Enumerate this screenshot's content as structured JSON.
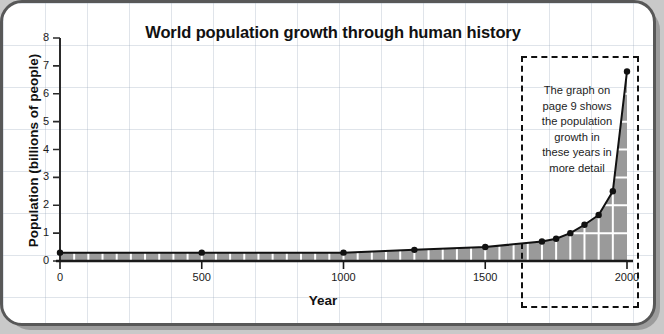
{
  "figure": {
    "title": "World population growth through human history",
    "x_axis_title": "Year",
    "y_axis_title": "Population (billions of people)",
    "callout_text": "The graph on page 9 shows the population growth in these years in more detail",
    "callout_lines": [
      "The graph on",
      "page 9 shows",
      "the population",
      "growth in",
      "these years in",
      "more detail"
    ]
  },
  "colors": {
    "frame_border": "#585858",
    "frame_shadow": "#9c9c9c",
    "page_background": "#c9c9c9",
    "plot_background": "#ffffff",
    "area_fill": "#9a9a9a",
    "line": "#111111",
    "marker": "#111111",
    "grid_stripe": "#ffffff",
    "callout_border": "#111111",
    "text": "#111111"
  },
  "chart_data": {
    "type": "area",
    "title": "World population growth through human history",
    "xlabel": "Year",
    "ylabel": "Population (billions of people)",
    "xlim": [
      0,
      2000
    ],
    "ylim": [
      0,
      8
    ],
    "grid": true,
    "legend": "none",
    "x_ticks": [
      0,
      500,
      1000,
      1500,
      2000
    ],
    "x_tick_labels": [
      "0",
      "500",
      "1000",
      "1500",
      "2000"
    ],
    "y_ticks": [
      0,
      1,
      2,
      3,
      4,
      5,
      6,
      7,
      8
    ],
    "y_tick_labels": [
      "0",
      "1",
      "2",
      "3",
      "4",
      "5",
      "6",
      "7",
      "8"
    ],
    "x": [
      0,
      500,
      1000,
      1250,
      1500,
      1700,
      1750,
      1800,
      1850,
      1900,
      1950,
      2000
    ],
    "values": [
      0.3,
      0.3,
      0.3,
      0.4,
      0.5,
      0.7,
      0.8,
      1.0,
      1.3,
      1.65,
      2.5,
      6.8
    ],
    "series": [
      {
        "name": "World population",
        "x": [
          0,
          500,
          1000,
          1250,
          1500,
          1700,
          1750,
          1800,
          1850,
          1900,
          1950,
          2000
        ],
        "values": [
          0.3,
          0.3,
          0.3,
          0.4,
          0.5,
          0.7,
          0.8,
          1.0,
          1.3,
          1.65,
          2.5,
          6.8
        ]
      }
    ],
    "annotations": [
      {
        "text": "The graph on page 9 shows the population growth in these years in more detail",
        "x_range": [
          1650,
          2050
        ],
        "style": "dashed-box"
      }
    ]
  }
}
